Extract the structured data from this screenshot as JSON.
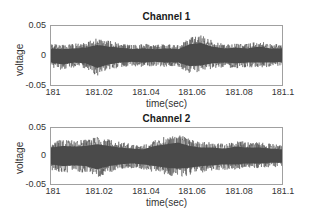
{
  "chart_data": [
    {
      "type": "line",
      "title": "Channel 1",
      "xlabel": "time(sec)",
      "ylabel": "voltage",
      "xlim": [
        181,
        181.1
      ],
      "ylim": [
        -0.05,
        0.05
      ],
      "xticks": [
        "181",
        "181.02",
        "181.04",
        "181.06",
        "181.08",
        "181.1"
      ],
      "yticks": [
        "0.05",
        "0",
        "-0.05"
      ],
      "grid": false,
      "series": [
        {
          "name": "Channel 1",
          "description": "dense noise-like signal, amplitude ~±0.02 with peaks to ~0.035",
          "envelope_upper": [
            0.02,
            0.018,
            0.02,
            0.022,
            0.03,
            0.025,
            0.022,
            0.018,
            0.02,
            0.018,
            0.02,
            0.018,
            0.032,
            0.035,
            0.025,
            0.02,
            0.022,
            0.02,
            0.025,
            0.02,
            0.02
          ],
          "envelope_lower": [
            -0.02,
            -0.025,
            -0.02,
            -0.022,
            -0.035,
            -0.025,
            -0.02,
            -0.018,
            -0.02,
            -0.018,
            -0.02,
            -0.02,
            -0.03,
            -0.028,
            -0.022,
            -0.02,
            -0.022,
            -0.02,
            -0.02,
            -0.02,
            -0.018
          ]
        }
      ]
    },
    {
      "type": "line",
      "title": "Channel 2",
      "xlabel": "time(sec)",
      "ylabel": "voltage",
      "xlim": [
        181,
        181.1
      ],
      "ylim": [
        -0.05,
        0.05
      ],
      "xticks": [
        "181",
        "181.02",
        "181.04",
        "181.06",
        "181.08",
        "181.1"
      ],
      "yticks": [
        "0.05",
        "0",
        "-0.05"
      ],
      "grid": false,
      "series": [
        {
          "name": "Channel 2",
          "description": "dense noise-like signal, amplitude ~±0.025 with peaks to ~0.04",
          "envelope_upper": [
            0.025,
            0.03,
            0.028,
            0.03,
            0.035,
            0.03,
            0.025,
            0.022,
            0.02,
            0.03,
            0.035,
            0.04,
            0.03,
            0.025,
            0.025,
            0.022,
            0.028,
            0.025,
            0.025,
            0.022,
            0.02
          ],
          "envelope_lower": [
            -0.025,
            -0.03,
            -0.028,
            -0.03,
            -0.04,
            -0.03,
            -0.025,
            -0.022,
            -0.025,
            -0.03,
            -0.035,
            -0.038,
            -0.035,
            -0.03,
            -0.028,
            -0.025,
            -0.025,
            -0.022,
            -0.022,
            -0.02,
            -0.02
          ]
        }
      ]
    }
  ],
  "signal_color": "#4a4a4a"
}
